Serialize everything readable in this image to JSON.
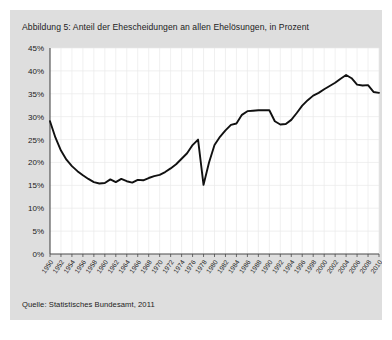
{
  "figure": {
    "title": "Abbildung 5: Anteil der Ehescheidungen an allen Ehelösungen, in Prozent",
    "source": "Quelle: Statistisches Bundesamt, 2011"
  },
  "chart_data": {
    "type": "line",
    "title": "Abbildung 5: Anteil der Ehescheidungen an allen Ehelösungen, in Prozent",
    "xlabel": "",
    "ylabel": "",
    "ylim": [
      0,
      45
    ],
    "xlim": [
      1950,
      2010
    ],
    "ytick_step": 5,
    "xtick_step": 2,
    "grid": true,
    "legend": "none",
    "yticks": [
      "0%",
      "5%",
      "10%",
      "15%",
      "20%",
      "25%",
      "30%",
      "35%",
      "40%",
      "45%"
    ],
    "ytick_values": [
      0,
      5,
      10,
      15,
      20,
      25,
      30,
      35,
      40,
      45
    ],
    "xticks": [
      "1950",
      "1952",
      "1954",
      "1956",
      "1958",
      "1960",
      "1962",
      "1964",
      "1966",
      "1968",
      "1970",
      "1972",
      "1974",
      "1976",
      "1978",
      "1980",
      "1982",
      "1984",
      "1986",
      "1988",
      "1990",
      "1992",
      "1994",
      "1996",
      "1998",
      "2000",
      "2002",
      "2004",
      "2006",
      "2008",
      "2010"
    ],
    "series": [
      {
        "name": "Anteil der Ehescheidungen an allen Ehelösungen",
        "color": "#111111",
        "x": [
          1950,
          1951,
          1952,
          1953,
          1954,
          1955,
          1956,
          1957,
          1958,
          1959,
          1960,
          1961,
          1962,
          1963,
          1964,
          1965,
          1966,
          1967,
          1968,
          1969,
          1970,
          1971,
          1972,
          1973,
          1974,
          1975,
          1976,
          1977,
          1978,
          1979,
          1980,
          1981,
          1982,
          1983,
          1984,
          1985,
          1986,
          1987,
          1988,
          1989,
          1990,
          1991,
          1992,
          1993,
          1994,
          1995,
          1996,
          1997,
          1998,
          1999,
          2000,
          2001,
          2002,
          2003,
          2004,
          2005,
          2006,
          2007,
          2008,
          2009,
          2010
        ],
        "values": [
          29.0,
          25.4,
          22.6,
          20.6,
          19.2,
          18.1,
          17.2,
          16.4,
          15.7,
          15.4,
          15.5,
          16.3,
          15.7,
          16.4,
          15.9,
          15.6,
          16.2,
          16.1,
          16.6,
          17.0,
          17.3,
          17.9,
          18.7,
          19.6,
          20.8,
          22.0,
          23.8,
          25.0,
          15.1,
          20.0,
          23.8,
          25.6,
          27.0,
          28.2,
          28.5,
          30.4,
          31.2,
          31.3,
          31.4,
          31.4,
          31.4,
          29.0,
          28.3,
          28.4,
          29.3,
          30.8,
          32.4,
          33.6,
          34.6,
          35.2,
          36.0,
          36.7,
          37.4,
          38.3,
          39.1,
          38.4,
          37.0,
          36.8,
          36.9,
          35.4,
          35.2
        ]
      }
    ],
    "annotations": [
      {
        "label": "Einbruch 1978 (Eherechtsreform)",
        "x": 1978,
        "y": 15.1
      },
      {
        "label": "Maximum",
        "x": 2004,
        "y": 39.1
      }
    ]
  }
}
